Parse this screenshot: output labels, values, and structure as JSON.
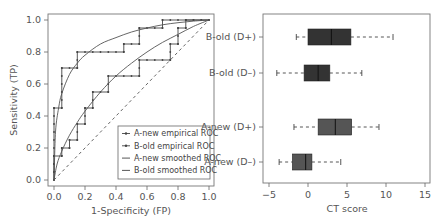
{
  "chart_data": [
    {
      "type": "line",
      "title": "",
      "xlabel": "1-Specificity (FP)",
      "ylabel": "Sensitivity (TP)",
      "xlim": [
        0,
        1
      ],
      "ylim": [
        0,
        1
      ],
      "xticks": [
        "0.0",
        "0.2",
        "0.4",
        "0.6",
        "0.8",
        "1.0"
      ],
      "yticks": [
        "0.0",
        "0.2",
        "0.4",
        "0.6",
        "0.8",
        "1.0"
      ],
      "grid": false,
      "legend_position": "lower right",
      "legend": [
        "A-new empirical ROC",
        "B-old empirical ROC",
        "A-new smoothed ROC",
        "B-old smoothed ROC"
      ],
      "series": [
        {
          "name": "A-new empirical ROC",
          "style": "step",
          "points": [
            [
              0,
              0
            ],
            [
              0,
              0.45
            ],
            [
              0.05,
              0.45
            ],
            [
              0.05,
              0.7
            ],
            [
              0.15,
              0.7
            ],
            [
              0.15,
              0.8
            ],
            [
              0.45,
              0.8
            ],
            [
              0.45,
              0.85
            ],
            [
              0.55,
              0.85
            ],
            [
              0.55,
              0.95
            ],
            [
              0.7,
              0.95
            ],
            [
              0.7,
              1.0
            ],
            [
              1.0,
              1.0
            ]
          ]
        },
        {
          "name": "B-old empirical ROC",
          "style": "step",
          "points": [
            [
              0,
              0
            ],
            [
              0,
              0.15
            ],
            [
              0.05,
              0.15
            ],
            [
              0.05,
              0.2
            ],
            [
              0.1,
              0.2
            ],
            [
              0.1,
              0.25
            ],
            [
              0.15,
              0.25
            ],
            [
              0.15,
              0.35
            ],
            [
              0.2,
              0.35
            ],
            [
              0.2,
              0.45
            ],
            [
              0.25,
              0.45
            ],
            [
              0.25,
              0.55
            ],
            [
              0.35,
              0.55
            ],
            [
              0.35,
              0.65
            ],
            [
              0.55,
              0.65
            ],
            [
              0.55,
              0.75
            ],
            [
              0.75,
              0.75
            ],
            [
              0.75,
              0.85
            ],
            [
              0.8,
              0.85
            ],
            [
              0.8,
              0.95
            ],
            [
              0.85,
              0.95
            ],
            [
              0.85,
              1.0
            ],
            [
              1.0,
              1.0
            ]
          ]
        },
        {
          "name": "A-new smoothed ROC",
          "style": "smooth",
          "points": [
            [
              0,
              0
            ],
            [
              0.01,
              0.3
            ],
            [
              0.03,
              0.45
            ],
            [
              0.05,
              0.54
            ],
            [
              0.1,
              0.66
            ],
            [
              0.15,
              0.73
            ],
            [
              0.2,
              0.78
            ],
            [
              0.3,
              0.85
            ],
            [
              0.4,
              0.89
            ],
            [
              0.5,
              0.925
            ],
            [
              0.6,
              0.95
            ],
            [
              0.7,
              0.97
            ],
            [
              0.8,
              0.983
            ],
            [
              0.9,
              0.993
            ],
            [
              1.0,
              1.0
            ]
          ]
        },
        {
          "name": "B-old smoothed ROC",
          "style": "smooth",
          "points": [
            [
              0,
              0
            ],
            [
              0.02,
              0.1
            ],
            [
              0.05,
              0.18
            ],
            [
              0.1,
              0.28
            ],
            [
              0.15,
              0.36
            ],
            [
              0.2,
              0.43
            ],
            [
              0.3,
              0.55
            ],
            [
              0.4,
              0.65
            ],
            [
              0.5,
              0.73
            ],
            [
              0.6,
              0.8
            ],
            [
              0.7,
              0.86
            ],
            [
              0.8,
              0.91
            ],
            [
              0.9,
              0.96
            ],
            [
              1.0,
              1.0
            ]
          ]
        },
        {
          "name": "chance",
          "style": "dashed",
          "points": [
            [
              0,
              0
            ],
            [
              1,
              1
            ]
          ]
        }
      ]
    },
    {
      "type": "box",
      "orientation": "horizontal",
      "title": "",
      "xlabel": "CT score",
      "ylabel": "",
      "xlim": [
        -5.5,
        15.5
      ],
      "xticks": [
        "-5",
        "0",
        "5",
        "10",
        "15"
      ],
      "categories": [
        "B-old (D+)",
        "B-old (D–)",
        "A-new (D+)",
        "A-new (D–)"
      ],
      "boxes": [
        {
          "label": "B-old (D+)",
          "min": -1.5,
          "q1": 0.0,
          "median": 3.0,
          "q3": 5.5,
          "max": 10.9,
          "color": "#333333"
        },
        {
          "label": "B-old (D–)",
          "min": -4.0,
          "q1": -0.5,
          "median": 1.3,
          "q3": 2.8,
          "max": 6.9,
          "color": "#333333"
        },
        {
          "label": "A-new (D+)",
          "min": -1.8,
          "q1": 1.3,
          "median": 3.5,
          "q3": 5.6,
          "max": 9.1,
          "color": "#555555"
        },
        {
          "label": "A-new (D–)",
          "min": -3.7,
          "q1": -2.0,
          "median": -0.3,
          "q3": 0.5,
          "max": 4.2,
          "color": "#555555"
        }
      ]
    }
  ]
}
